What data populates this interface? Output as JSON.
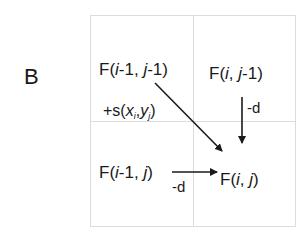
{
  "panel_label": "B",
  "cells": {
    "top_left": {
      "name": "F",
      "open": "(",
      "i_part": "i",
      "i_suffix": "-1, ",
      "j_part": "j",
      "j_suffix": "-1",
      "close": ")"
    },
    "top_right": {
      "name": "F",
      "open": "(",
      "i_part": "i",
      "i_suffix": ", ",
      "j_part": "j",
      "j_suffix": "-1",
      "close": ")"
    },
    "bottom_left": {
      "name": "F",
      "open": "(",
      "i_part": "i",
      "i_suffix": "-1, ",
      "j_part": "j",
      "j_suffix": "",
      "close": ")"
    },
    "bottom_right": {
      "name": "F",
      "open": "(",
      "i_part": "i",
      "i_suffix": ", ",
      "j_part": "j",
      "j_suffix": "",
      "close": ")"
    }
  },
  "edges": {
    "diagonal": {
      "from": "top_left",
      "to": "bottom_right",
      "label_prefix": "+s(",
      "x": "x",
      "x_sub": "i",
      "sep": ",",
      "y": "y",
      "y_sub": "j",
      "label_suffix": ")"
    },
    "vertical": {
      "from": "top_right",
      "to": "bottom_right",
      "label": "-d"
    },
    "horizontal": {
      "from": "bottom_left",
      "to": "bottom_right",
      "label": "-d"
    }
  },
  "colors": {
    "grid": "#d9d9d9",
    "arrow": "#1a1a1a",
    "text": "#1a1a1a"
  }
}
